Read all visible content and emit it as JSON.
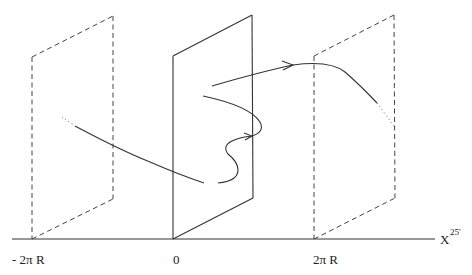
{
  "diagram": {
    "axis": {
      "label": "X",
      "superscript": "25'",
      "ticks": [
        {
          "name": "minus-2pi-r",
          "label": "- 2π R"
        },
        {
          "name": "zero",
          "label": "0"
        },
        {
          "name": "plus-2pi-r",
          "label": "2π R"
        }
      ]
    },
    "planes": [
      {
        "name": "left-image-plane",
        "style": "dashed",
        "position": "-2πR"
      },
      {
        "name": "center-plane",
        "style": "solid",
        "position": "0"
      },
      {
        "name": "right-image-plane",
        "style": "dashed",
        "position": "2πR"
      }
    ],
    "curves": [
      {
        "name": "string-path-left",
        "description": "incoming curve crossing left plane into center plane"
      },
      {
        "name": "string-path-wiggle",
        "description": "S-shaped curve with arrow crossing center plane"
      },
      {
        "name": "string-path-right",
        "description": "outgoing curve with arrow crossing right plane"
      }
    ]
  }
}
